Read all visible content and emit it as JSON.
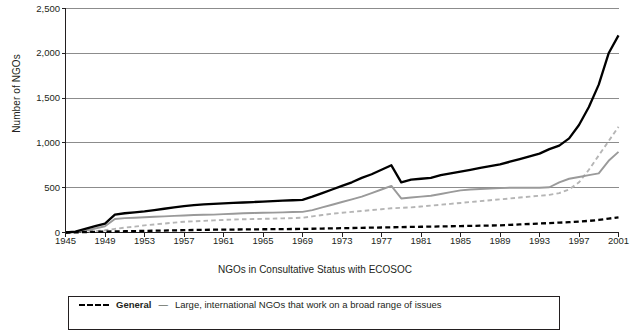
{
  "axes": {
    "y_title": "Number of NGOs",
    "x_title": "NGOs in Consultative Status with ECOSOC",
    "y_ticks": [
      "2,500",
      "2,000",
      "1,500",
      "1,000",
      "500",
      "0"
    ],
    "x_ticks": [
      "1945",
      "1949",
      "1953",
      "1957",
      "1961",
      "1965",
      "1969",
      "1973",
      "1977",
      "1981",
      "1985",
      "1989",
      "1993",
      "1997",
      "2001"
    ]
  },
  "legend": {
    "items": [
      {
        "name": "General",
        "dash": "—",
        "description": "Large, international NGOs that work on a broad range of issues",
        "color": "#000000",
        "style": "dashed"
      }
    ]
  },
  "colors": {
    "total": "#000000",
    "general": "#000000",
    "special": "#9a9a9a",
    "roster": "#b5b5b5",
    "grid": "#8c8c8c",
    "axis": "#231f20"
  },
  "chart_data": {
    "type": "line",
    "title": "",
    "xlabel": "NGOs in Consultative Status with ECOSOC",
    "ylabel": "Number of NGOs",
    "xlim": [
      1945,
      2001
    ],
    "ylim": [
      0,
      2500
    ],
    "grid": true,
    "legend_position": "bottom",
    "x": [
      1945,
      1946,
      1947,
      1948,
      1949,
      1950,
      1951,
      1952,
      1953,
      1954,
      1955,
      1956,
      1957,
      1958,
      1959,
      1960,
      1961,
      1962,
      1963,
      1964,
      1965,
      1966,
      1967,
      1968,
      1969,
      1970,
      1971,
      1972,
      1973,
      1974,
      1975,
      1976,
      1977,
      1978,
      1979,
      1980,
      1981,
      1982,
      1983,
      1984,
      1985,
      1986,
      1987,
      1988,
      1989,
      1990,
      1991,
      1992,
      1993,
      1994,
      1995,
      1996,
      1997,
      1998,
      1999,
      2000,
      2001
    ],
    "series": [
      {
        "name": "Total",
        "style": "solid",
        "color": "#000000",
        "values": [
          0,
          10,
          40,
          70,
          100,
          200,
          215,
          225,
          235,
          250,
          265,
          280,
          295,
          305,
          315,
          320,
          325,
          330,
          335,
          340,
          345,
          350,
          355,
          360,
          365,
          400,
          440,
          480,
          520,
          560,
          610,
          650,
          700,
          750,
          560,
          590,
          600,
          610,
          640,
          660,
          680,
          700,
          720,
          740,
          760,
          790,
          820,
          850,
          880,
          930,
          970,
          1050,
          1200,
          1400,
          1650,
          2000,
          2200
        ]
      },
      {
        "name": "Roster",
        "style": "dashed",
        "color": "#b5b5b5",
        "values": [
          0,
          3,
          8,
          15,
          25,
          40,
          55,
          65,
          80,
          90,
          100,
          110,
          120,
          125,
          130,
          135,
          140,
          145,
          148,
          150,
          152,
          155,
          158,
          160,
          165,
          180,
          195,
          210,
          220,
          230,
          240,
          250,
          260,
          270,
          275,
          280,
          290,
          300,
          310,
          320,
          330,
          340,
          350,
          360,
          370,
          380,
          390,
          400,
          410,
          420,
          440,
          480,
          560,
          700,
          860,
          1020,
          1180
        ]
      },
      {
        "name": "Special",
        "style": "solid",
        "color": "#9a9a9a",
        "values": [
          0,
          5,
          20,
          45,
          70,
          150,
          160,
          165,
          170,
          175,
          180,
          185,
          190,
          195,
          198,
          200,
          205,
          210,
          215,
          218,
          220,
          222,
          225,
          228,
          230,
          250,
          280,
          310,
          340,
          370,
          400,
          440,
          480,
          520,
          380,
          390,
          400,
          410,
          430,
          450,
          470,
          480,
          485,
          490,
          495,
          500,
          500,
          500,
          500,
          505,
          560,
          600,
          620,
          640,
          660,
          800,
          900
        ]
      },
      {
        "name": "General",
        "style": "dashed",
        "color": "#000000",
        "values": [
          0,
          2,
          5,
          8,
          10,
          12,
          14,
          16,
          18,
          20,
          22,
          24,
          26,
          28,
          30,
          31,
          32,
          33,
          34,
          35,
          36,
          37,
          38,
          39,
          40,
          42,
          44,
          46,
          48,
          50,
          52,
          54,
          56,
          58,
          60,
          62,
          64,
          66,
          68,
          70,
          72,
          74,
          76,
          78,
          80,
          85,
          90,
          95,
          100,
          105,
          110,
          115,
          122,
          130,
          140,
          155,
          170
        ]
      }
    ]
  }
}
